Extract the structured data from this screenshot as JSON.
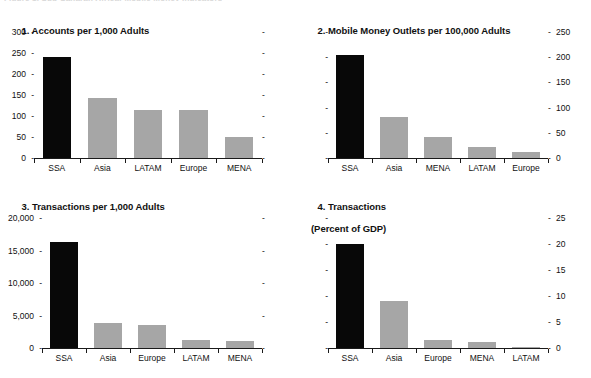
{
  "figure": {
    "clipped_header": "Figure 1. Sub-Saharan Africa: Mobile Money Indicators",
    "highlight_region": "SSA",
    "colors": {
      "highlight_bar": "#080808",
      "other_bar": "#a6a6a6",
      "axis": "#1a1a1a",
      "text": "#111111",
      "background": "#ffffff"
    }
  },
  "chart_data": [
    {
      "type": "bar",
      "panel_number": "1.",
      "title": "1. Accounts per 1,000 Adults",
      "title_lines": [
        "1. Accounts per 1,000 Adults"
      ],
      "categories": [
        "SSA",
        "Asia",
        "LATAM",
        "Europe",
        "MENA"
      ],
      "values": [
        240,
        144,
        115,
        114,
        49
      ],
      "highlight": "SSA",
      "xlabel": "",
      "ylabel": "",
      "ylim": [
        0,
        300
      ],
      "yticks": [
        0,
        50,
        100,
        150,
        200,
        250,
        300
      ],
      "ytick_labels": [
        "0",
        "50",
        "100",
        "150",
        "200",
        "250",
        "300"
      ],
      "axis_labels_side": "left",
      "right_axis_ticks_unlabeled": true,
      "grid": false,
      "legend": "none"
    },
    {
      "type": "bar",
      "panel_number": "2.",
      "title": "2. Mobile Money Outlets per 100,000 Adults",
      "title_lines": [
        "2. Mobile Money Outlets per 100,000 Adults"
      ],
      "categories": [
        "SSA",
        "Asia",
        "MENA",
        "LATAM",
        "Europe"
      ],
      "values": [
        205,
        82,
        42,
        22,
        12
      ],
      "highlight": "SSA",
      "xlabel": "",
      "ylabel": "",
      "ylim": [
        0,
        250
      ],
      "yticks": [
        0,
        50,
        100,
        150,
        200,
        250
      ],
      "ytick_labels": [
        "0",
        "50",
        "100",
        "150",
        "200",
        "250"
      ],
      "axis_labels_side": "right",
      "left_axis_ticks_unlabeled": true,
      "grid": false,
      "legend": "none"
    },
    {
      "type": "bar",
      "panel_number": "3.",
      "title": "3. Transactions per 1,000 Adults",
      "title_lines": [
        "3. Transactions per 1,000 Adults"
      ],
      "categories": [
        "SSA",
        "Asia",
        "Europe",
        "LATAM",
        "MENA"
      ],
      "values": [
        16300,
        3900,
        3500,
        1200,
        1100
      ],
      "highlight": "SSA",
      "xlabel": "",
      "ylabel": "",
      "ylim": [
        0,
        20000
      ],
      "yticks": [
        0,
        5000,
        10000,
        15000,
        20000
      ],
      "ytick_labels": [
        "0",
        "5,000",
        "10,000",
        "15,000",
        "20,000"
      ],
      "axis_labels_side": "left",
      "right_axis_ticks_unlabeled": true,
      "grid": false,
      "legend": "none"
    },
    {
      "type": "bar",
      "panel_number": "4.",
      "title": "4. Transactions (Percent of GDP)",
      "title_lines": [
        "4. Transactions",
        "(Percent of GDP)"
      ],
      "categories": [
        "SSA",
        "Asia",
        "Europe",
        "MENA",
        "LATAM"
      ],
      "values": [
        20,
        9,
        1.5,
        1.2,
        0.2
      ],
      "highlight": "SSA",
      "xlabel": "",
      "ylabel": "",
      "ylim": [
        0,
        25
      ],
      "yticks": [
        0,
        5,
        10,
        15,
        20,
        25
      ],
      "ytick_labels": [
        "0",
        "5",
        "10",
        "15",
        "20",
        "25"
      ],
      "axis_labels_side": "right",
      "left_axis_ticks_unlabeled": true,
      "grid": false,
      "legend": "none"
    }
  ]
}
